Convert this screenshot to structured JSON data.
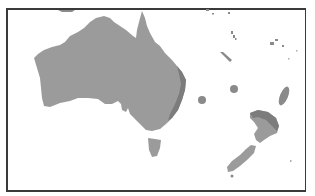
{
  "map": {
    "type": "regional-map",
    "region": "Australia and New Zealand / Southwest Pacific",
    "colors": {
      "land": "#9b9b9b",
      "highlight_shade": "#7c7c7c",
      "islands": "#8a8a8a",
      "border": "#3a3a3a",
      "water": "#ffffff"
    },
    "features": [
      {
        "name": "Australia",
        "shaded_band": "east coast"
      },
      {
        "name": "Tasmania"
      },
      {
        "name": "New Zealand North Island",
        "shaded_band": "Northland"
      },
      {
        "name": "New Zealand South Island"
      },
      {
        "name": "Lord Howe Island",
        "marker": "circle"
      },
      {
        "name": "Norfolk Island",
        "marker": "circle"
      },
      {
        "name": "Kermadec Islands",
        "marker": "ellipse"
      },
      {
        "name": "New Caledonia"
      },
      {
        "name": "Vanuatu"
      },
      {
        "name": "Fiji"
      },
      {
        "name": "Solomon Islands"
      },
      {
        "name": "New Guinea (partial)"
      }
    ],
    "labels": []
  }
}
